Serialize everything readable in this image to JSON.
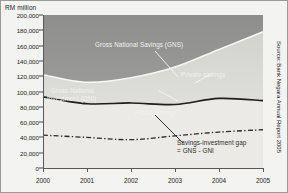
{
  "axis": {
    "y_unit_label": "RM million",
    "y_ticks": [
      "200,000",
      "180,000",
      "160,000",
      "140,000",
      "120,000",
      "100,000",
      "80,000",
      "60,000",
      "40,000",
      "20,000",
      "0"
    ],
    "x_ticks": [
      "2000",
      "2001",
      "2002",
      "2003",
      "2004",
      "2005"
    ]
  },
  "annotations": {
    "gns": "Gross National Savings (GNS)",
    "gni_line1": "Gross National",
    "gni_line2": "Investment (GNI)",
    "private": "Private savings",
    "public": "Public savings",
    "gap_line1": "Savings-investment gap",
    "gap_line2": "= GNS - GNI"
  },
  "source": "Source: Bank Negara Annual Report 2005",
  "colors": {
    "gns_line": "#f4f4f2",
    "gni_line": "#1f1f1f",
    "public_line": "#2b2b2b",
    "plot_upper_fill": "#9d9d9b",
    "gap_fill": "#d8d8d4",
    "below_fill": "#ececea",
    "frame": "#9a9a96"
  },
  "chart_data": {
    "type": "area",
    "xlabel": "",
    "ylabel": "RM million",
    "ylim": [
      0,
      200000
    ],
    "xlim": [
      2000,
      2005
    ],
    "grid": false,
    "legend": "inline annotations",
    "x": [
      2000,
      2001,
      2002,
      2003,
      2004,
      2005
    ],
    "series": [
      {
        "name": "Gross National Savings (GNS)",
        "style": "solid-white",
        "values": [
          122000,
          112000,
          118000,
          132000,
          155000,
          178000
        ]
      },
      {
        "name": "Gross National Investment (GNI)",
        "style": "solid-dark",
        "values": [
          93000,
          84000,
          85000,
          83000,
          91000,
          88000
        ]
      },
      {
        "name": "Public savings",
        "style": "dash-dot",
        "values": [
          43000,
          40000,
          37000,
          42000,
          47000,
          50000
        ]
      }
    ],
    "derived": {
      "name": "Savings-investment gap = GNS - GNI",
      "values": [
        29000,
        28000,
        33000,
        49000,
        64000,
        90000
      ]
    }
  }
}
